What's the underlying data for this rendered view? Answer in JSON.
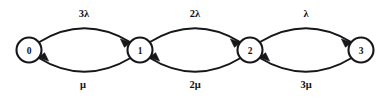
{
  "diagram": {
    "kind": "state-transition-diagram",
    "title": "",
    "background_color": "#ffffff",
    "ink_color": "#17171a",
    "width": 391,
    "height": 97,
    "states": [
      {
        "id": "s0",
        "label": "0",
        "cx": 29,
        "cy": 50,
        "r": 12.5
      },
      {
        "id": "s1",
        "label": "1",
        "cx": 140,
        "cy": 50,
        "r": 12.5
      },
      {
        "id": "s2",
        "label": "2",
        "cx": 250,
        "cy": 50,
        "r": 12.5
      },
      {
        "id": "s3",
        "label": "3",
        "cx": 361,
        "cy": 50,
        "r": 12.5
      }
    ],
    "transitions": [
      {
        "id": "t0up",
        "from": "0",
        "to": "1",
        "direction": "forward",
        "label": "3λ",
        "label_x": 84,
        "label_y": 13,
        "path": "M 38.5 42.5 Q 84 14 131 42.5",
        "arrow": "M 131 42.5 L 120.4 38.9 L 124.4 47.3 Z"
      },
      {
        "id": "t1dn",
        "from": "1",
        "to": "0",
        "direction": "backward",
        "label": "μ",
        "label_x": 83,
        "label_y": 84,
        "path": "M 131.5 57.5 Q 84 86 38 57.5",
        "arrow": "M 38 57.5 L 48.6 61.1 L 44.6 52.7 Z"
      },
      {
        "id": "t1up",
        "from": "1",
        "to": "2",
        "direction": "forward",
        "label": "2λ",
        "label_x": 195,
        "label_y": 13,
        "path": "M 149 42.5 Q 195 14 241 42.5",
        "arrow": "M 241 42.5 L 230.4 38.9 L 234.4 47.3 Z"
      },
      {
        "id": "t2dn",
        "from": "2",
        "to": "1",
        "direction": "backward",
        "label": "2μ",
        "label_x": 195,
        "label_y": 84,
        "path": "M 241.5 57.5 Q 195 86 149 57.5",
        "arrow": "M 149 57.5 L 159.6 61.1 L 155.6 52.7 Z"
      },
      {
        "id": "t2up",
        "from": "2",
        "to": "3",
        "direction": "forward",
        "label": "λ",
        "label_x": 306,
        "label_y": 13,
        "path": "M 259 42.5 Q 306 14 352 42.5",
        "arrow": "M 352 42.5 L 341.4 38.9 L 345.4 47.3 Z"
      },
      {
        "id": "t3dn",
        "from": "3",
        "to": "2",
        "direction": "backward",
        "label": "3μ",
        "label_x": 306,
        "label_y": 84,
        "path": "M 352.5 57.5 Q 306 86 259 57.5",
        "arrow": "M 259 57.5 L 269.6 61.1 L 265.6 52.7 Z"
      }
    ]
  }
}
